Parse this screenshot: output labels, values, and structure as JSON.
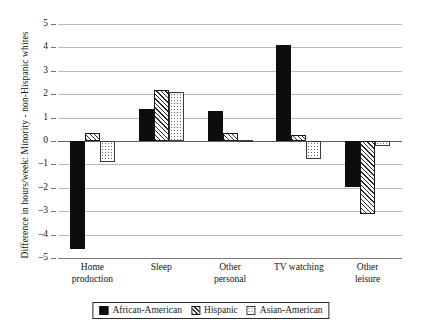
{
  "chart_data": {
    "type": "bar",
    "title": "",
    "xlabel": "",
    "ylabel": "Difference in hours/week: Minority - non-Hispanic whites",
    "ylim": [
      -5,
      5
    ],
    "yticks": [
      5,
      4,
      3,
      2,
      1,
      0,
      -1,
      -2,
      -3,
      -4,
      -5
    ],
    "ytick_labels": [
      "5",
      "4",
      "3",
      "2",
      "1",
      "0",
      "–1",
      "–2",
      "–3",
      "–4",
      "–5"
    ],
    "grid": true,
    "legend_position": "bottom",
    "categories": [
      "Home production",
      "Sleep",
      "Other personal",
      "TV watching",
      "Other leisure"
    ],
    "category_lines": [
      [
        "Home",
        "production"
      ],
      [
        "Sleep"
      ],
      [
        "Other",
        "personal"
      ],
      [
        "TV watching"
      ],
      [
        "Other leisure"
      ]
    ],
    "series": [
      {
        "name": "African-American",
        "pattern": "solid-black",
        "color": "#0d0d0d",
        "values": [
          -4.6,
          1.35,
          1.3,
          4.1,
          -1.95
        ]
      },
      {
        "name": "Hispanic",
        "pattern": "diagonal-hatch",
        "color": "#ffffff",
        "values": [
          0.35,
          2.2,
          0.35,
          0.25,
          -3.1
        ]
      },
      {
        "name": "Asian-American",
        "pattern": "dotted",
        "color": "#ffffff",
        "values": [
          -0.9,
          2.08,
          0.05,
          -0.75,
          -0.2
        ]
      }
    ]
  },
  "legend": {
    "items": [
      {
        "label": "African-American",
        "swatch": "solid-black-swatch"
      },
      {
        "label": "Hispanic",
        "swatch": "hatch-swatch"
      },
      {
        "label": "Asian-American",
        "swatch": "dotted-swatch"
      }
    ]
  }
}
